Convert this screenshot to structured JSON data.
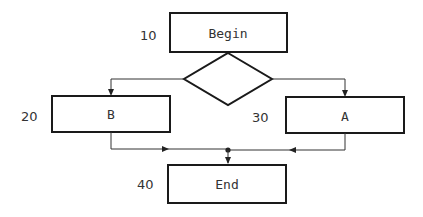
{
  "diagram": {
    "type": "flowchart",
    "nodes": [
      {
        "id": "begin",
        "label": "Begin",
        "number": "10",
        "shape": "rect"
      },
      {
        "id": "decision",
        "label": "",
        "shape": "diamond"
      },
      {
        "id": "b",
        "label": "B",
        "number": "20",
        "shape": "rect"
      },
      {
        "id": "a",
        "label": "A",
        "number": "30",
        "shape": "rect"
      },
      {
        "id": "end",
        "label": "End",
        "number": "40",
        "shape": "rect"
      }
    ],
    "edges": [
      {
        "from": "begin",
        "to": "decision"
      },
      {
        "from": "decision",
        "to": "b"
      },
      {
        "from": "decision",
        "to": "a"
      },
      {
        "from": "b",
        "to": "end"
      },
      {
        "from": "a",
        "to": "end"
      }
    ]
  },
  "labels": {
    "begin": "Begin",
    "b": "B",
    "a": "A",
    "end": "End",
    "n10": "10",
    "n20": "20",
    "n30": "30",
    "n40": "40"
  }
}
